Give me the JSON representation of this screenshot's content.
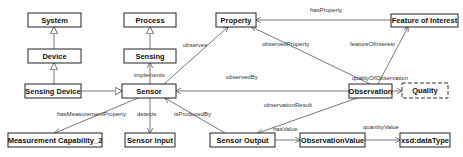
{
  "diagram": {
    "nodes": [
      {
        "id": "system",
        "label": "System",
        "x": 28,
        "y": 13,
        "w": 53,
        "h": 14,
        "style": "solid"
      },
      {
        "id": "process",
        "label": "Process",
        "x": 124,
        "y": 13,
        "w": 52,
        "h": 14,
        "style": "solid"
      },
      {
        "id": "property",
        "label": "Property",
        "x": 216,
        "y": 13,
        "w": 40,
        "h": 14,
        "style": "solid"
      },
      {
        "id": "feature-of-interest",
        "label": "Feature of Interest",
        "x": 391,
        "y": 14,
        "w": 67,
        "h": 13,
        "style": "solid"
      },
      {
        "id": "device",
        "label": "Device",
        "x": 28,
        "y": 49,
        "w": 53,
        "h": 14,
        "style": "solid"
      },
      {
        "id": "sensing",
        "label": "Sensing",
        "x": 124,
        "y": 49,
        "w": 52,
        "h": 14,
        "style": "solid"
      },
      {
        "id": "sensing-device",
        "label": "Sensing Device",
        "x": 25,
        "y": 84,
        "w": 56,
        "h": 14,
        "style": "solid"
      },
      {
        "id": "sensor",
        "label": "Sensor",
        "x": 122,
        "y": 84,
        "w": 54,
        "h": 14,
        "style": "solid"
      },
      {
        "id": "observation",
        "label": "Observation",
        "x": 349,
        "y": 84,
        "w": 43,
        "h": 14,
        "style": "solid"
      },
      {
        "id": "quality",
        "label": "Quality",
        "x": 402,
        "y": 83,
        "w": 46,
        "h": 15,
        "style": "dashed"
      },
      {
        "id": "measurement-capability",
        "label": "Measurement Capability_2",
        "x": 8,
        "y": 133,
        "w": 94,
        "h": 14,
        "style": "solid"
      },
      {
        "id": "sensor-input",
        "label": "Sensor Input",
        "x": 125,
        "y": 133,
        "w": 50,
        "h": 14,
        "style": "solid"
      },
      {
        "id": "sensor-output",
        "label": "Sensor Output",
        "x": 210,
        "y": 133,
        "w": 65,
        "h": 14,
        "style": "solid"
      },
      {
        "id": "observation-value",
        "label": "ObservationValue",
        "x": 300,
        "y": 133,
        "w": 65,
        "h": 14,
        "style": "solid"
      },
      {
        "id": "xsd-datatype",
        "label": "xsd:dataType",
        "x": 400,
        "y": 133,
        "w": 50,
        "h": 14,
        "style": "solid"
      }
    ],
    "edges": [
      {
        "id": "device-system",
        "label": "",
        "type": "generalization",
        "x1": 54,
        "y1": 49,
        "x2": 54,
        "y2": 27,
        "lx": 0,
        "ly": 0
      },
      {
        "id": "sensingdevice-device",
        "label": "",
        "type": "generalization",
        "x1": 54,
        "y1": 84,
        "x2": 54,
        "y2": 63,
        "lx": 0,
        "ly": 0
      },
      {
        "id": "sensing-process",
        "label": "",
        "type": "generalization",
        "x1": 150,
        "y1": 49,
        "x2": 150,
        "y2": 27,
        "lx": 0,
        "ly": 0
      },
      {
        "id": "sensingdevice-sensor",
        "label": "",
        "type": "generalization",
        "x1": 81,
        "y1": 91,
        "x2": 122,
        "y2": 91,
        "lx": 0,
        "ly": 0
      },
      {
        "id": "implements",
        "label": "implements",
        "type": "arrow",
        "x1": 150,
        "y1": 84,
        "x2": 150,
        "y2": 63,
        "lx": 134,
        "ly": 77
      },
      {
        "id": "observes",
        "label": "observes",
        "type": "arrow",
        "x1": 164,
        "y1": 84,
        "x2": 228,
        "y2": 27,
        "lx": 183,
        "ly": 47
      },
      {
        "id": "has-property",
        "label": "hasProperty",
        "type": "arrow",
        "x1": 391,
        "y1": 20,
        "x2": 256,
        "y2": 20,
        "lx": 310,
        "ly": 12
      },
      {
        "id": "observed-property",
        "label": "observedProperty",
        "type": "arrow",
        "x1": 370,
        "y1": 84,
        "x2": 252,
        "y2": 27,
        "lx": 262,
        "ly": 46
      },
      {
        "id": "feature-of-interest-edge",
        "label": "featureOfInterest",
        "type": "arrow",
        "x1": 378,
        "y1": 84,
        "x2": 408,
        "y2": 27,
        "lx": 350,
        "ly": 46
      },
      {
        "id": "observed-by",
        "label": "observedBy",
        "type": "arrow",
        "x1": 349,
        "y1": 91,
        "x2": 176,
        "y2": 91,
        "lx": 226,
        "ly": 79
      },
      {
        "id": "quality-of-observation",
        "label": "qualityOfObservation",
        "type": "arrow",
        "x1": 392,
        "y1": 91,
        "x2": 402,
        "y2": 91,
        "lx": 352,
        "ly": 80
      },
      {
        "id": "has-measurement-property",
        "label": "hasMeasurementProperty",
        "type": "arrow",
        "x1": 138,
        "y1": 98,
        "x2": 55,
        "y2": 133,
        "lx": 57,
        "ly": 116
      },
      {
        "id": "detects",
        "label": "detects",
        "type": "arrow",
        "x1": 150,
        "y1": 98,
        "x2": 150,
        "y2": 133,
        "lx": 137,
        "ly": 116
      },
      {
        "id": "is-produced-by",
        "label": "isProducedBy",
        "type": "arrow",
        "x1": 225,
        "y1": 133,
        "x2": 165,
        "y2": 98,
        "lx": 174,
        "ly": 116
      },
      {
        "id": "observation-result",
        "label": "observationResult",
        "type": "arrow",
        "x1": 357,
        "y1": 98,
        "x2": 258,
        "y2": 133,
        "lx": 264,
        "ly": 107
      },
      {
        "id": "has-value",
        "label": "hasValue",
        "type": "arrow",
        "x1": 275,
        "y1": 140,
        "x2": 300,
        "y2": 140,
        "lx": 273,
        "ly": 131
      },
      {
        "id": "quantity-value",
        "label": "quantityValue",
        "type": "arrow",
        "x1": 365,
        "y1": 140,
        "x2": 400,
        "y2": 140,
        "lx": 363,
        "ly": 129
      }
    ]
  }
}
